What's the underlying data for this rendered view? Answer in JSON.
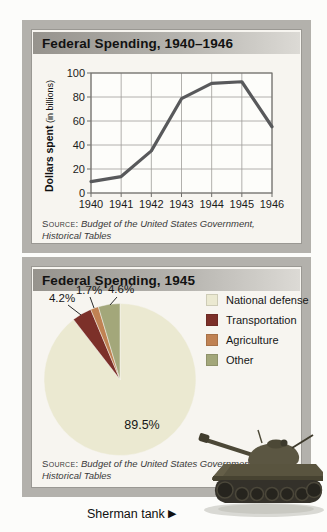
{
  "line_card": {
    "title": "Federal Spending, 1940–1946",
    "y_axis_title": "Dollars spent",
    "y_axis_subtitle": " (in billions)",
    "source_label": "Source:",
    "source_text_line1": " Budget of the United States Government,",
    "source_text_line2": "Historical Tables"
  },
  "pie_card": {
    "title": "Federal Spending, 1945",
    "source_label": "Source:",
    "source_text_line1": " Budget of the United States Government,",
    "source_text_line2": "Historical Tables"
  },
  "caption": {
    "text": "Sherman tank ",
    "arrow": "▶"
  },
  "chart_data": [
    {
      "type": "line",
      "title": "Federal Spending, 1940–1946",
      "x": [
        1940,
        1941,
        1942,
        1943,
        1944,
        1945,
        1946
      ],
      "values": [
        9.5,
        13.7,
        35.1,
        78.6,
        91.3,
        92.7,
        55.2
      ],
      "xlabel": "",
      "ylabel": "Dollars spent (in billions)",
      "ylim": [
        0,
        100
      ],
      "yticks": [
        0,
        20,
        40,
        60,
        80,
        100
      ],
      "grid": true,
      "line_color": "#58595b",
      "grid_color": "#9e9d99",
      "axis_color": "#6f6e6a"
    },
    {
      "type": "pie",
      "title": "Federal Spending, 1945",
      "start_angle": "12 o'clock",
      "direction": "clockwise",
      "legend_position": "right",
      "slices": [
        {
          "label": "National defense",
          "value": 89.5,
          "pct_label": "89.5%",
          "color": "#ebe9d1"
        },
        {
          "label": "Transportation",
          "value": 4.2,
          "pct_label": "4.2%",
          "color": "#7c3029"
        },
        {
          "label": "Agriculture",
          "value": 1.7,
          "pct_label": "1.7%",
          "color": "#c08253"
        },
        {
          "label": "Other",
          "value": 4.6,
          "pct_label": "4.6%",
          "color": "#a3a77a"
        }
      ]
    }
  ]
}
